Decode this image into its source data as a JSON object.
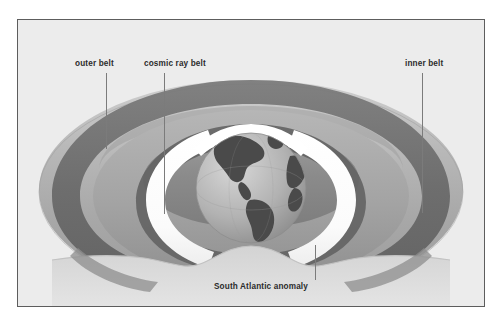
{
  "figure": {
    "background_color": "#ececec",
    "border_color": "#5d5d5d",
    "page_background": "#ffffff"
  },
  "labels": {
    "outer_belt": "outer belt",
    "cosmic_ray_belt": "cosmic ray belt",
    "inner_belt": "inner belt",
    "south_atlantic_anomaly": "South Atlantic anomaly"
  },
  "palette": {
    "belt_light": "#bfbfbf",
    "belt_mid": "#a6a6a6",
    "belt_dark": "#6e6e6e",
    "belt_darker": "#5a5a5a",
    "belt_shadow": "#8a8a8a",
    "cosmic_ray_white": "#ffffff",
    "earth_ocean": "#b4b4b4",
    "earth_land": "#4a4a4a",
    "leader_line": "#7b7b7b",
    "text": "#2b2b2b"
  },
  "elements": {
    "earth_globe": "earth-globe",
    "outer_torus": "outer-belt-torus",
    "inner_torus": "inner-belt-torus",
    "cosmic_crescent_left": "cosmic-ray-crescent-left",
    "cosmic_crescent_right": "cosmic-ray-crescent-right"
  }
}
